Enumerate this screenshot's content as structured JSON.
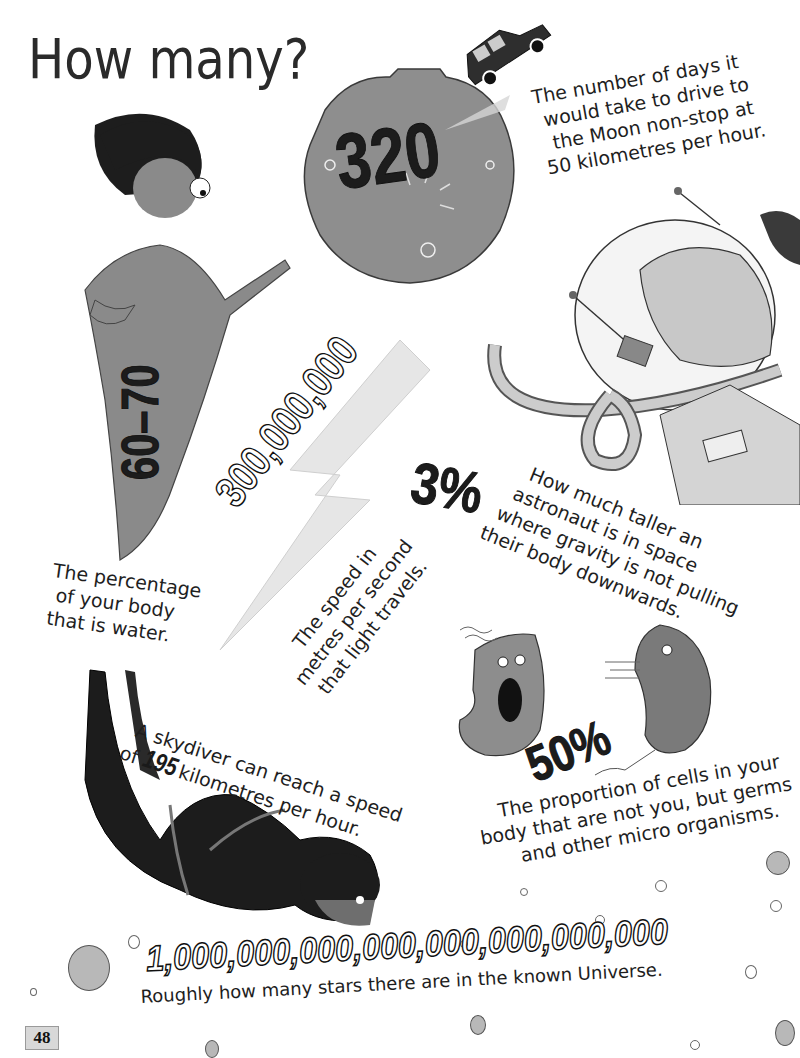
{
  "page": {
    "title": "How many?",
    "page_number": "48"
  },
  "facts": [
    {
      "id": "moon-drive",
      "number": "320",
      "caption_lines": [
        "The number of days it",
        "would take to drive to",
        "the Moon non-stop at",
        "50 kilometres per hour."
      ],
      "illustration": "moon-with-car"
    },
    {
      "id": "body-water",
      "number": "60–70",
      "caption_lines": [
        "The percentage",
        "of your body",
        "that is water."
      ],
      "illustration": "child-figure"
    },
    {
      "id": "light-speed",
      "number": "300,000,000",
      "caption_lines": [
        "The speed in",
        "metres per second",
        "that light travels."
      ],
      "illustration": "lightning-bolt"
    },
    {
      "id": "astronaut-height",
      "number": "3%",
      "caption_lines": [
        "How much taller an",
        "astronaut is in space",
        "where gravity is not pulling",
        "their body downwards."
      ],
      "illustration": "astronaut-helmet"
    },
    {
      "id": "skydiver-speed",
      "number": "195",
      "caption_prefix": "A skydiver can reach a speed",
      "caption_of": "of",
      "caption_suffix": "kilometres per hour.",
      "illustration": "skydiver"
    },
    {
      "id": "body-cells",
      "number": "50%",
      "caption_lines": [
        "The proportion of cells in your",
        "body that are not you, but germs",
        "and other micro organisms."
      ],
      "illustration": "germs"
    },
    {
      "id": "universe-stars",
      "number": "1,000,000,000,000,000,000,000,000",
      "caption_lines": [
        "Roughly how many stars there are in the known Universe."
      ],
      "illustration": "bubbles"
    }
  ],
  "colors": {
    "background": "#ffffff",
    "ink": "#1e1e1e",
    "grey_fill": "#8c8c8c",
    "dark_fill": "#1c1c1c",
    "page_tab": "#d8d8d8"
  }
}
